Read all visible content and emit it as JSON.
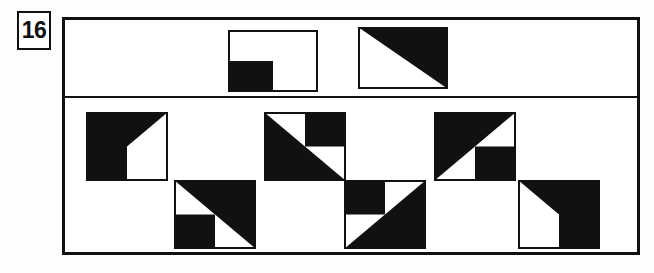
{
  "item": {
    "number": "16",
    "type": "visual-analogy-figure-matrix"
  },
  "frame": {
    "border_color": "#111111",
    "background": "#ffffff",
    "divider_label": "stimulus-options-divider"
  },
  "stimulus": {
    "label": "stimulus-row",
    "figures": [
      {
        "id": "stimulus-1",
        "name": "square-with-black-lower-left-quadrant",
        "w": 90,
        "h": 62,
        "x": 228,
        "y": 30,
        "regions": [
          "lower-left-quadrant-black"
        ],
        "polygons": [
          [
            [
              0,
              31
            ],
            [
              45,
              31
            ],
            [
              45,
              62
            ],
            [
              0,
              62
            ]
          ]
        ]
      },
      {
        "id": "stimulus-2",
        "name": "square-with-black-upper-right-triangle",
        "w": 90,
        "h": 62,
        "x": 358,
        "y": 27,
        "regions": [
          "upper-right-triangle-black"
        ],
        "polygons": [
          [
            [
              0,
              0
            ],
            [
              90,
              0
            ],
            [
              90,
              62
            ]
          ]
        ]
      }
    ]
  },
  "options": {
    "label": "answer-options",
    "row1_label": "options-row-1",
    "row2_label": "options-row-2",
    "figures": [
      {
        "id": "option-a",
        "name": "option-a-black-left-with-white-lower-right-and-white-upper-right-triangle",
        "w": 82,
        "h": 69,
        "x": 86,
        "y": 112,
        "regions": [
          "all-black-except-lower-right-quadrant-and-upper-right-triangle-white"
        ],
        "polygons": [
          [
            [
              0,
              0
            ],
            [
              82,
              0
            ],
            [
              41,
              34.5
            ],
            [
              41,
              69
            ],
            [
              0,
              69
            ]
          ]
        ]
      },
      {
        "id": "option-b",
        "name": "option-b-lower-left-triangle-black-plus-upper-right-quadrant-black",
        "w": 82,
        "h": 69,
        "x": 264,
        "y": 112,
        "regions": [
          "lower-left-triangle-black",
          "upper-right-quadrant-black"
        ],
        "polygons": [
          [
            [
              0,
              0
            ],
            [
              82,
              69
            ],
            [
              0,
              69
            ]
          ],
          [
            [
              41,
              0
            ],
            [
              82,
              0
            ],
            [
              82,
              34.5
            ],
            [
              41,
              34.5
            ]
          ]
        ]
      },
      {
        "id": "option-c",
        "name": "option-c-upper-left-triangle-black-plus-lower-right-quadrant-black",
        "w": 82,
        "h": 69,
        "x": 434,
        "y": 112,
        "regions": [
          "upper-left-triangle-black",
          "lower-right-quadrant-black"
        ],
        "polygons": [
          [
            [
              0,
              0
            ],
            [
              82,
              0
            ],
            [
              0,
              69
            ]
          ],
          [
            [
              41,
              34.5
            ],
            [
              82,
              34.5
            ],
            [
              82,
              69
            ],
            [
              41,
              69
            ]
          ]
        ]
      },
      {
        "id": "option-d",
        "name": "option-d-upper-right-triangle-black-plus-lower-left-quadrant-black",
        "w": 82,
        "h": 69,
        "x": 174,
        "y": 180,
        "regions": [
          "upper-right-triangle-black",
          "lower-left-quadrant-black"
        ],
        "polygons": [
          [
            [
              0,
              0
            ],
            [
              82,
              0
            ],
            [
              82,
              69
            ]
          ],
          [
            [
              0,
              34.5
            ],
            [
              41,
              34.5
            ],
            [
              41,
              69
            ],
            [
              0,
              69
            ]
          ]
        ]
      },
      {
        "id": "option-e",
        "name": "option-e-lower-right-triangle-black-plus-upper-left-quadrant-black",
        "w": 82,
        "h": 69,
        "x": 344,
        "y": 180,
        "regions": [
          "lower-right-triangle-black",
          "upper-left-quadrant-black"
        ],
        "polygons": [
          [
            [
              0,
              69
            ],
            [
              82,
              0
            ],
            [
              82,
              69
            ]
          ],
          [
            [
              0,
              0
            ],
            [
              41,
              0
            ],
            [
              41,
              34.5
            ],
            [
              0,
              34.5
            ]
          ]
        ]
      },
      {
        "id": "option-f",
        "name": "option-f-black-right-with-white-lower-left-and-black-upper-left-triangle",
        "w": 82,
        "h": 69,
        "x": 518,
        "y": 180,
        "regions": [
          "all-black-except-lower-left-quadrant-and-lower-left-triangle-white"
        ],
        "polygons": [
          [
            [
              0,
              0
            ],
            [
              82,
              0
            ],
            [
              82,
              69
            ],
            [
              41,
              69
            ],
            [
              41,
              34.5
            ]
          ]
        ]
      }
    ]
  }
}
